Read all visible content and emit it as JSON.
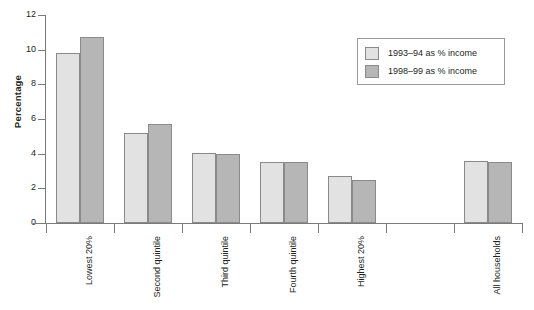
{
  "chart_data": {
    "type": "bar",
    "title": "",
    "xlabel": "",
    "ylabel": "Percentage",
    "ylim": [
      0,
      12
    ],
    "yticks": [
      0,
      2,
      4,
      6,
      8,
      10,
      12
    ],
    "ytick_labels": [
      "0",
      "2",
      "4",
      "6",
      "8",
      "10",
      "12"
    ],
    "grid": false,
    "legend_position": "top-right",
    "categories": [
      "Lowest 20%",
      "Second quintile",
      "Third quintile",
      "Fourth quintile",
      "Highest 20%",
      "",
      "All households"
    ],
    "series": [
      {
        "name": "1993–94 as % income",
        "color": "#e2e2e2",
        "values": [
          9.8,
          5.2,
          4.05,
          3.5,
          2.7,
          null,
          3.6
        ]
      },
      {
        "name": "1998–99 as % income",
        "color": "#b6b6b6",
        "values": [
          10.75,
          5.7,
          4.0,
          3.5,
          2.5,
          null,
          3.5
        ]
      }
    ]
  },
  "legend": {
    "items": [
      {
        "label": "1993–94 as % income",
        "swatch": "light-grey-swatch"
      },
      {
        "label": "1998–99 as % income",
        "swatch": "dark-grey-swatch"
      }
    ]
  },
  "axes": {
    "y_title": "Percentage"
  }
}
